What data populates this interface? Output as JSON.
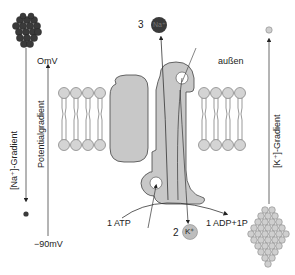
{
  "diagram": {
    "labels": {
      "outside": "außen",
      "na_gradient": "[Na⁺]-Gradient",
      "k_gradient": "[K⁺]-Gradient",
      "potential_gradient": "Potentialgradient",
      "potential_top": "OmV",
      "potential_bottom": "−90mV",
      "na_count": "3",
      "na_ion": "Na⁺",
      "k_count": "2",
      "k_ion": "K⁺",
      "atp": "1 ATP",
      "adp": "1 ADP+1P"
    },
    "colors": {
      "protein": "#c8c8c8",
      "lipid_head": "#d4d4d4",
      "na_dark": "#3a3a3a",
      "k_light": "#bdbdbd",
      "line": "#333333"
    }
  }
}
